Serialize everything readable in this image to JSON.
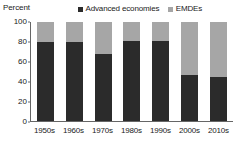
{
  "chart_data": {
    "type": "bar",
    "subtype": "stacked-percentage",
    "title": "",
    "xlabel": "",
    "ylabel": "Percent",
    "ylim": [
      0,
      100
    ],
    "yticks": [
      0,
      20,
      40,
      60,
      80,
      100
    ],
    "ytick_labels": [
      "0",
      "20",
      "40",
      "60",
      "80",
      "100"
    ],
    "grid": false,
    "legend_position": "top",
    "categories": [
      "1950s",
      "1960s",
      "1970s",
      "1980s",
      "1990s",
      "2000s",
      "2010s"
    ],
    "series": [
      {
        "name": "Advanced economies",
        "color": "#2b2b2b",
        "values": [
          80,
          80,
          68,
          81,
          81,
          46,
          44
        ]
      },
      {
        "name": "EMDEs",
        "color": "#a6a6a6",
        "values": [
          20,
          20,
          32,
          19,
          19,
          54,
          56
        ]
      }
    ]
  },
  "axis": {
    "y_title": "Percent"
  },
  "legend": {
    "entries": [
      {
        "label": "Advanced economies",
        "color": "#2b2b2b"
      },
      {
        "label": "EMDEs",
        "color": "#a6a6a6"
      }
    ]
  },
  "colors": {
    "advanced_economies": "#2b2b2b",
    "emdes": "#a6a6a6",
    "axis": "#666666",
    "background": "#ffffff",
    "text": "#1a1a1a"
  }
}
